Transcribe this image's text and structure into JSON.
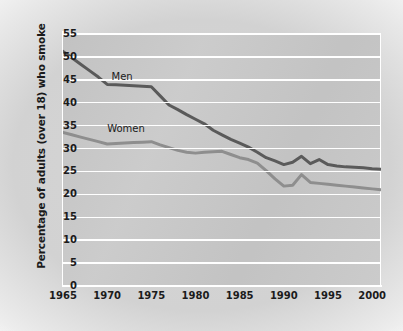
{
  "chart_data": {
    "type": "line",
    "title": "",
    "xlabel": "",
    "ylabel": "Percentage of adults (over 18) who smoke",
    "xlim": [
      1965,
      2001
    ],
    "ylim": [
      0,
      55
    ],
    "grid": true,
    "legend_position": "inline-annotation",
    "y_ticks": [
      0,
      5,
      10,
      15,
      20,
      25,
      30,
      35,
      40,
      45,
      50,
      55
    ],
    "y_tick_labels": [
      "0",
      "5",
      "10",
      "15",
      "20",
      "25",
      "30",
      "35",
      "40",
      "45",
      "50",
      "55"
    ],
    "x_ticks": [
      1965,
      1970,
      1975,
      1980,
      1985,
      1990,
      1995,
      2000
    ],
    "x_tick_labels": [
      "1965",
      "1970",
      "1975",
      "1980",
      "1985",
      "1990",
      "1995",
      "2000"
    ],
    "x": [
      1965,
      1966,
      1967,
      1968,
      1969,
      1970,
      1971,
      1972,
      1973,
      1974,
      1975,
      1976,
      1977,
      1978,
      1979,
      1980,
      1981,
      1982,
      1983,
      1984,
      1985,
      1986,
      1987,
      1988,
      1989,
      1990,
      1991,
      1992,
      1993,
      1994,
      1995,
      1996,
      1997,
      1998,
      1999,
      2000,
      2001
    ],
    "series": [
      {
        "name": "Men",
        "color": "#5a5a5a",
        "label": "Men",
        "values": [
          51.2,
          49.8,
          48.4,
          47.0,
          45.6,
          44.0,
          43.9,
          43.8,
          43.7,
          43.6,
          43.5,
          41.5,
          39.5,
          38.5,
          37.4,
          36.4,
          35.4,
          34.0,
          33.0,
          32.0,
          31.2,
          30.3,
          29.2,
          28.0,
          27.3,
          26.5,
          27.0,
          28.3,
          26.7,
          27.6,
          26.5,
          26.2,
          26.0,
          25.9,
          25.8,
          25.6,
          25.5
        ]
      },
      {
        "name": "Women",
        "color": "#8e8e8e",
        "label": "Women",
        "values": [
          33.5,
          33.0,
          32.5,
          32.0,
          31.5,
          31.0,
          31.1,
          31.2,
          31.3,
          31.4,
          31.5,
          30.8,
          30.2,
          29.6,
          29.2,
          29.0,
          29.2,
          29.3,
          29.4,
          28.7,
          28.0,
          27.6,
          26.8,
          25.2,
          23.4,
          21.8,
          22.0,
          24.3,
          22.6,
          22.4,
          22.2,
          22.0,
          21.8,
          21.6,
          21.4,
          21.2,
          21.0
        ]
      }
    ],
    "annotations": [
      {
        "text": "Men",
        "x": 1970.5,
        "y": 45.5
      },
      {
        "text": "Women",
        "x": 1970.0,
        "y": 34.0
      }
    ]
  }
}
